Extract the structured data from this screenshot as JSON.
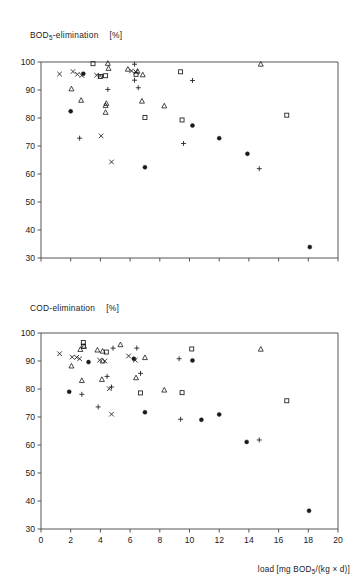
{
  "figure": {
    "background": "#ffffff",
    "axis_color": "#555555",
    "marker_color": "#1a1a1a",
    "xlabel": "load [mg BOD5/(kg × d)]",
    "xlabel_parts": {
      "pre": "load  [mg  BOD",
      "sub": "5",
      "post": "/(kg × d)]"
    }
  },
  "chart_data": [
    {
      "type": "scatter",
      "title": "BOD5-elimination   [%]",
      "title_parts": {
        "pre": "BOD",
        "sub": "5",
        "post": "-elimination",
        "unit": "[%]"
      },
      "xlabel": "",
      "ylabel": "BOD5-elimination [%]",
      "xlim": [
        0,
        20
      ],
      "ylim": [
        30,
        100
      ],
      "xticks": [
        0,
        2,
        4,
        6,
        8,
        10,
        12,
        14,
        16,
        18,
        20
      ],
      "xticklabels": [
        "",
        "",
        "",
        "",
        "",
        "",
        "",
        "",
        "",
        "",
        ""
      ],
      "yticks": [
        30,
        40,
        50,
        60,
        70,
        80,
        90,
        100
      ],
      "yticklabels": [
        "30",
        "40",
        "50",
        "60",
        "70",
        "80",
        "90",
        "100"
      ],
      "grid": false,
      "legend": "none",
      "series": [
        {
          "name": "cross",
          "marker": "x",
          "points": [
            [
              1.25,
              95.7
            ],
            [
              2.15,
              96.6
            ],
            [
              2.45,
              95.6
            ],
            [
              2.75,
              95.2
            ],
            [
              3.75,
              95.3
            ],
            [
              4.0,
              95.0
            ],
            [
              6.1,
              96.8
            ],
            [
              6.4,
              96.4
            ],
            [
              4.05,
              73.6
            ],
            [
              4.75,
              64.3
            ]
          ]
        },
        {
          "name": "triangle",
          "marker": "triangle",
          "points": [
            [
              2.05,
              90.4
            ],
            [
              2.7,
              86.3
            ],
            [
              4.5,
              99.5
            ],
            [
              4.55,
              97.7
            ],
            [
              4.4,
              85.2
            ],
            [
              4.35,
              84.4
            ],
            [
              4.35,
              82.0
            ],
            [
              5.85,
              97.4
            ],
            [
              6.5,
              96.7
            ],
            [
              6.85,
              95.4
            ],
            [
              6.8,
              86.0
            ],
            [
              8.3,
              84.3
            ],
            [
              14.8,
              99.2
            ]
          ]
        },
        {
          "name": "square",
          "marker": "square",
          "points": [
            [
              3.5,
              99.4
            ],
            [
              4.0,
              94.8
            ],
            [
              4.35,
              95.1
            ],
            [
              6.4,
              95.6
            ],
            [
              7.0,
              80.2
            ],
            [
              9.4,
              96.5
            ],
            [
              9.5,
              79.3
            ],
            [
              16.55,
              81.0
            ]
          ]
        },
        {
          "name": "filled-circle",
          "marker": "circle",
          "points": [
            [
              2.85,
              95.8
            ],
            [
              2.0,
              82.4
            ],
            [
              7.0,
              62.4
            ],
            [
              10.2,
              77.3
            ],
            [
              12.0,
              72.8
            ],
            [
              13.9,
              67.2
            ],
            [
              18.1,
              33.9
            ]
          ]
        },
        {
          "name": "plus",
          "marker": "plus",
          "points": [
            [
              2.6,
              72.8
            ],
            [
              4.5,
              90.2
            ],
            [
              6.3,
              99.2
            ],
            [
              6.55,
              90.8
            ],
            [
              6.3,
              93.5
            ],
            [
              9.6,
              70.9
            ],
            [
              10.2,
              93.4
            ],
            [
              14.7,
              61.9
            ]
          ]
        }
      ]
    },
    {
      "type": "scatter",
      "title": "COD-elimination   [%]",
      "title_parts": {
        "pre": "COD-elimination",
        "sub": "",
        "post": "",
        "unit": "[%]"
      },
      "xlabel": "load [mg BOD5/(kg × d)]",
      "ylabel": "COD-elimination [%]",
      "xlim": [
        0,
        20
      ],
      "ylim": [
        30,
        100
      ],
      "xticks": [
        0,
        2,
        4,
        6,
        8,
        10,
        12,
        14,
        16,
        18,
        20
      ],
      "xticklabels": [
        "0",
        "2",
        "4",
        "6",
        "8",
        "10",
        "12",
        "14",
        "16",
        "18",
        "20"
      ],
      "yticks": [
        30,
        40,
        50,
        60,
        70,
        80,
        90,
        100
      ],
      "yticklabels": [
        "30",
        "40",
        "50",
        "60",
        "70",
        "80",
        "90",
        "100"
      ],
      "grid": false,
      "legend": "none",
      "series": [
        {
          "name": "cross",
          "marker": "x",
          "points": [
            [
              1.25,
              92.6
            ],
            [
              2.1,
              91.4
            ],
            [
              2.4,
              91.3
            ],
            [
              2.6,
              90.8
            ],
            [
              3.95,
              90.3
            ],
            [
              4.3,
              90.0
            ],
            [
              4.6,
              80.1
            ],
            [
              4.75,
              71.0
            ],
            [
              5.9,
              91.8
            ],
            [
              6.35,
              90.3
            ]
          ]
        },
        {
          "name": "triangle",
          "marker": "triangle",
          "points": [
            [
              2.05,
              88.2
            ],
            [
              2.65,
              94.1
            ],
            [
              2.9,
              95.2
            ],
            [
              2.75,
              83.0
            ],
            [
              3.8,
              93.9
            ],
            [
              4.15,
              93.5
            ],
            [
              4.1,
              83.4
            ],
            [
              4.15,
              90.0
            ],
            [
              5.35,
              95.8
            ],
            [
              6.4,
              84.0
            ],
            [
              7.0,
              91.2
            ],
            [
              8.3,
              79.6
            ],
            [
              14.8,
              94.2
            ]
          ]
        },
        {
          "name": "square",
          "marker": "square",
          "points": [
            [
              2.85,
              96.6
            ],
            [
              2.85,
              95.3
            ],
            [
              4.4,
              93.2
            ],
            [
              6.7,
              78.6
            ],
            [
              9.5,
              78.7
            ],
            [
              10.15,
              94.3
            ],
            [
              16.55,
              75.8
            ]
          ]
        },
        {
          "name": "filled-circle",
          "marker": "circle",
          "points": [
            [
              3.2,
              89.6
            ],
            [
              1.9,
              79.0
            ],
            [
              6.25,
              90.8
            ],
            [
              7.0,
              71.7
            ],
            [
              10.2,
              90.2
            ],
            [
              10.8,
              69.0
            ],
            [
              12.0,
              70.9
            ],
            [
              13.85,
              61.1
            ],
            [
              18.05,
              36.5
            ]
          ]
        },
        {
          "name": "plus",
          "marker": "plus",
          "points": [
            [
              2.75,
              78.1
            ],
            [
              3.85,
              73.6
            ],
            [
              4.45,
              84.5
            ],
            [
              4.75,
              80.7
            ],
            [
              4.85,
              94.6
            ],
            [
              6.45,
              94.6
            ],
            [
              6.7,
              85.6
            ],
            [
              9.3,
              90.8
            ],
            [
              9.4,
              69.2
            ],
            [
              14.7,
              61.8
            ]
          ]
        }
      ]
    }
  ]
}
